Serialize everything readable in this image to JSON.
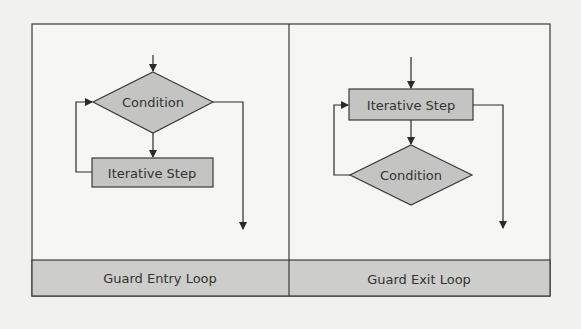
{
  "panels": [
    {
      "caption": "Guard Entry Loop",
      "nodes": {
        "decision": "Condition",
        "process": "Iterative Step"
      }
    },
    {
      "caption": "Guard Exit Loop",
      "nodes": {
        "process": "Iterative Step",
        "decision": "Condition"
      }
    }
  ],
  "colors": {
    "background": "#f1f1ef",
    "panel_fill": "#f6f6f4",
    "shape_fill": "#c4c4c2",
    "caption_fill": "#cdcdcb",
    "stroke": "#3a3a3a",
    "text": "#333333"
  }
}
